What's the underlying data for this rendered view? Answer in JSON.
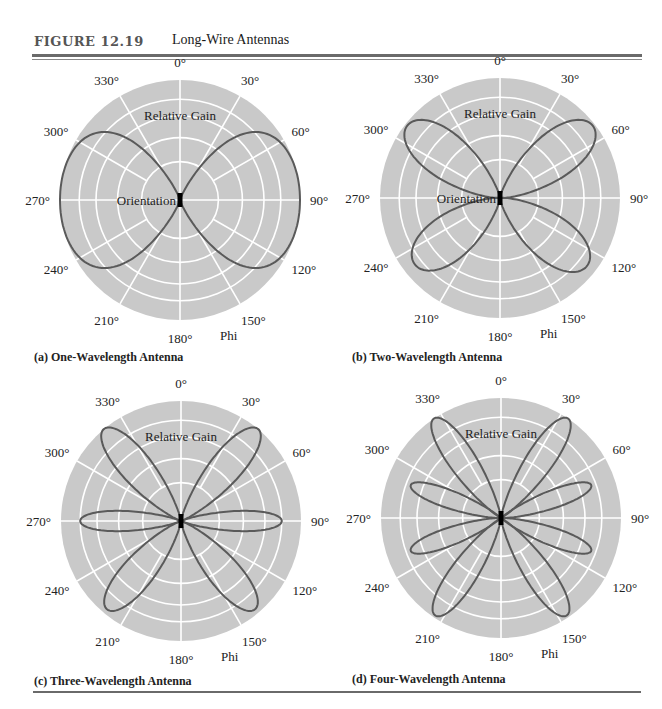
{
  "figure": {
    "label": "FIGURE 12.19",
    "title": "Long-Wire Antennas"
  },
  "colors": {
    "disc": "#c9c9c9",
    "grid": "#ffffff",
    "lobe": "#5a5a5a",
    "wire": "#000000"
  },
  "chart_data": [
    {
      "type": "polar",
      "id": "a",
      "caption": "(a) One-Wavelength Antenna",
      "angle_ticks": [
        "0°",
        "30°",
        "60°",
        "90°",
        "120°",
        "150°",
        "180°",
        "210°",
        "240°",
        "270°",
        "300°",
        "330°"
      ],
      "radial_label": "Relative Gain",
      "center_label": "Orientation",
      "angle_axis_label": "Phi",
      "grid_rings_fraction": [
        0.32,
        0.52,
        0.7,
        0.84,
        1.0
      ],
      "lobes": [
        {
          "angle_deg": 90,
          "length": 1.0,
          "half_width": 0.6
        },
        {
          "angle_deg": 270,
          "length": 1.0,
          "half_width": 0.6
        }
      ]
    },
    {
      "type": "polar",
      "id": "b",
      "caption": "(b) Two-Wavelength Antenna",
      "angle_ticks": [
        "0°",
        "30°",
        "60°",
        "90°",
        "120°",
        "150°",
        "180°",
        "210°",
        "240°",
        "270°",
        "300°",
        "330°"
      ],
      "radial_label": "Relative Gain",
      "center_label": "Orientation",
      "angle_axis_label": "Phi",
      "grid_rings_fraction": [
        0.32,
        0.52,
        0.7,
        0.84,
        1.0
      ],
      "lobes": [
        {
          "angle_deg": 52,
          "length": 0.98,
          "half_width": 0.2
        },
        {
          "angle_deg": 128,
          "length": 0.92,
          "half_width": 0.2
        },
        {
          "angle_deg": 232,
          "length": 0.9,
          "half_width": 0.2
        },
        {
          "angle_deg": 308,
          "length": 0.98,
          "half_width": 0.2
        }
      ]
    },
    {
      "type": "polar",
      "id": "c",
      "caption": "(c) Three-Wavelength Antenna",
      "angle_ticks": [
        "0°",
        "30°",
        "60°",
        "90°",
        "120°",
        "150°",
        "180°",
        "210°",
        "240°",
        "270°",
        "300°",
        "330°"
      ],
      "radial_label": "Relative Gain",
      "center_label": "",
      "angle_axis_label": "Phi",
      "grid_rings_fraction": [
        0.32,
        0.52,
        0.7,
        0.84,
        1.0
      ],
      "lobes": [
        {
          "angle_deg": 40,
          "length": 1.0,
          "half_width": 0.14
        },
        {
          "angle_deg": 90,
          "length": 0.84,
          "half_width": 0.09
        },
        {
          "angle_deg": 140,
          "length": 0.96,
          "half_width": 0.14
        },
        {
          "angle_deg": 220,
          "length": 0.96,
          "half_width": 0.14
        },
        {
          "angle_deg": 270,
          "length": 0.84,
          "half_width": 0.09
        },
        {
          "angle_deg": 320,
          "length": 1.0,
          "half_width": 0.14
        }
      ]
    },
    {
      "type": "polar",
      "id": "d",
      "caption": "(d) Four-Wavelength Antenna",
      "angle_ticks": [
        "0°",
        "30°",
        "60°",
        "90°",
        "120°",
        "150°",
        "180°",
        "210°",
        "240°",
        "270°",
        "300°",
        "330°"
      ],
      "radial_label": "Relative Gain",
      "center_label": "",
      "angle_axis_label": "Phi",
      "grid_rings_fraction": [
        0.32,
        0.52,
        0.7,
        0.84,
        1.0
      ],
      "lobes": [
        {
          "angle_deg": 34,
          "length": 1.0,
          "half_width": 0.12
        },
        {
          "angle_deg": 70,
          "length": 0.8,
          "half_width": 0.08
        },
        {
          "angle_deg": 110,
          "length": 0.8,
          "half_width": 0.08
        },
        {
          "angle_deg": 146,
          "length": 0.98,
          "half_width": 0.12
        },
        {
          "angle_deg": 214,
          "length": 0.98,
          "half_width": 0.12
        },
        {
          "angle_deg": 250,
          "length": 0.8,
          "half_width": 0.08
        },
        {
          "angle_deg": 290,
          "length": 0.8,
          "half_width": 0.08
        },
        {
          "angle_deg": 326,
          "length": 1.0,
          "half_width": 0.12
        }
      ]
    }
  ]
}
